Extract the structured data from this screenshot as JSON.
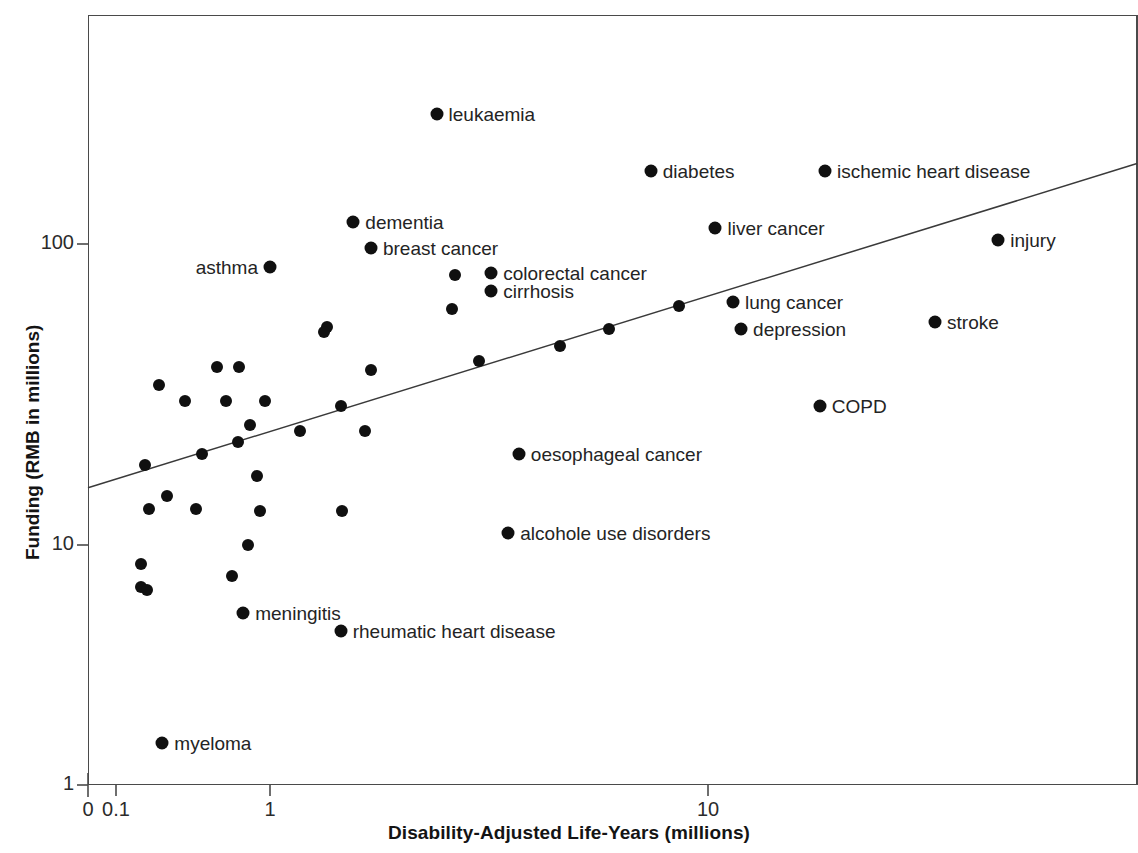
{
  "chart_data": {
    "type": "scatter",
    "title": "",
    "xlabel": "Disability-Adjusted Life-Years (millions)",
    "ylabel": "Funding (RMB in millions)",
    "xscale": "log",
    "yscale": "log",
    "xlim": [
      0.08,
      60
    ],
    "ylim": [
      1,
      400
    ],
    "grid": false,
    "legend": null,
    "x_ticks": [
      {
        "label": "0",
        "value": 0
      },
      {
        "label": "0.1",
        "value": 0.1
      },
      {
        "label": "1",
        "value": 1
      },
      {
        "label": "10",
        "value": 10
      }
    ],
    "y_ticks": [
      {
        "label": "1",
        "value": 1
      },
      {
        "label": "10",
        "value": 10
      },
      {
        "label": "100",
        "value": 100
      }
    ],
    "trendline": {
      "present": true,
      "x1": 0.08,
      "y1": 15.5,
      "x2": 60,
      "y2": 185
    },
    "points": [
      {
        "label": "leukaemia",
        "x": 2.4,
        "y": 270,
        "label_pos": "right"
      },
      {
        "label": "diabetes",
        "x": 7.4,
        "y": 175,
        "label_pos": "right"
      },
      {
        "label": "ischemic heart disease",
        "x": 18.5,
        "y": 175,
        "label_pos": "right"
      },
      {
        "label": "dementia",
        "x": 1.55,
        "y": 118,
        "label_pos": "right"
      },
      {
        "label": "liver cancer",
        "x": 10.4,
        "y": 113,
        "label_pos": "right"
      },
      {
        "label": "injury",
        "x": 46,
        "y": 103,
        "label_pos": "right"
      },
      {
        "label": "breast cancer",
        "x": 1.7,
        "y": 97,
        "label_pos": "right"
      },
      {
        "label": "asthma",
        "x": 1.0,
        "y": 84,
        "label_pos": "left"
      },
      {
        "label": "colorectal cancer",
        "x": 3.2,
        "y": 80,
        "label_pos": "right"
      },
      {
        "label": "cirrhosis",
        "x": 3.2,
        "y": 70,
        "label_pos": "right"
      },
      {
        "label": "lung cancer",
        "x": 11.4,
        "y": 64,
        "label_pos": "right"
      },
      {
        "label": "depression",
        "x": 11.9,
        "y": 52,
        "label_pos": "right"
      },
      {
        "label": "stroke",
        "x": 33,
        "y": 55,
        "label_pos": "right"
      },
      {
        "label": "COPD",
        "x": 18,
        "y": 29,
        "label_pos": "right"
      },
      {
        "label": "oesophageal cancer",
        "x": 3.7,
        "y": 20,
        "label_pos": "right"
      },
      {
        "label": "alcohole use disorders",
        "x": 3.5,
        "y": 11,
        "label_pos": "right"
      },
      {
        "label": "meningitis",
        "x": 0.67,
        "y": 5.2,
        "label_pos": "right"
      },
      {
        "label": "rheumatic heart disease",
        "x": 1.45,
        "y": 4.4,
        "label_pos": "right"
      },
      {
        "label": "myeloma",
        "x": 0.2,
        "y": 1.5,
        "label_pos": "right"
      },
      {
        "label": "",
        "x": 2.65,
        "y": 79,
        "label_pos": "none"
      },
      {
        "label": "",
        "x": 2.6,
        "y": 61,
        "label_pos": "none"
      },
      {
        "label": "",
        "x": 1.35,
        "y": 53,
        "label_pos": "none"
      },
      {
        "label": "",
        "x": 1.33,
        "y": 51,
        "label_pos": "none"
      },
      {
        "label": "",
        "x": 5.95,
        "y": 52,
        "label_pos": "none"
      },
      {
        "label": "",
        "x": 8.6,
        "y": 62,
        "label_pos": "none"
      },
      {
        "label": "",
        "x": 4.6,
        "y": 46,
        "label_pos": "none"
      },
      {
        "label": "",
        "x": 3.0,
        "y": 41,
        "label_pos": "none"
      },
      {
        "label": "",
        "x": 1.7,
        "y": 38,
        "label_pos": "none"
      },
      {
        "label": "",
        "x": 0.45,
        "y": 39,
        "label_pos": "none"
      },
      {
        "label": "",
        "x": 0.63,
        "y": 39,
        "label_pos": "none"
      },
      {
        "label": "",
        "x": 0.19,
        "y": 34,
        "label_pos": "none"
      },
      {
        "label": "",
        "x": 0.28,
        "y": 30,
        "label_pos": "none"
      },
      {
        "label": "",
        "x": 0.52,
        "y": 30,
        "label_pos": "none"
      },
      {
        "label": "",
        "x": 0.93,
        "y": 30,
        "label_pos": "none"
      },
      {
        "label": "",
        "x": 1.45,
        "y": 29,
        "label_pos": "none"
      },
      {
        "label": "",
        "x": 0.74,
        "y": 25,
        "label_pos": "none"
      },
      {
        "label": "",
        "x": 1.17,
        "y": 24,
        "label_pos": "none"
      },
      {
        "label": "",
        "x": 1.65,
        "y": 24,
        "label_pos": "none"
      },
      {
        "label": "",
        "x": 0.62,
        "y": 22,
        "label_pos": "none"
      },
      {
        "label": "",
        "x": 0.36,
        "y": 20,
        "label_pos": "none"
      },
      {
        "label": "",
        "x": 0.155,
        "y": 18.5,
        "label_pos": "none"
      },
      {
        "label": "",
        "x": 0.82,
        "y": 17,
        "label_pos": "none"
      },
      {
        "label": "",
        "x": 0.215,
        "y": 14.5,
        "label_pos": "none"
      },
      {
        "label": "",
        "x": 0.165,
        "y": 13.2,
        "label_pos": "none"
      },
      {
        "label": "",
        "x": 0.33,
        "y": 13.2,
        "label_pos": "none"
      },
      {
        "label": "",
        "x": 0.86,
        "y": 13.0,
        "label_pos": "none"
      },
      {
        "label": "",
        "x": 1.46,
        "y": 13.0,
        "label_pos": "none"
      },
      {
        "label": "",
        "x": 0.72,
        "y": 10.0,
        "label_pos": "none"
      },
      {
        "label": "",
        "x": 0.145,
        "y": 8.3,
        "label_pos": "none"
      },
      {
        "label": "",
        "x": 0.57,
        "y": 7.4,
        "label_pos": "none"
      },
      {
        "label": "",
        "x": 0.145,
        "y": 6.7,
        "label_pos": "none"
      },
      {
        "label": "",
        "x": 0.16,
        "y": 6.5,
        "label_pos": "none"
      }
    ]
  },
  "axis": {
    "x_title": "Disability-Adjusted Life-Years (millions)",
    "y_title": "Funding (RMB in millions)"
  },
  "colors": {
    "point": "#101010",
    "axis": "#4a4a4a",
    "text": "#1a1a1a",
    "trendline": "#3a3a3a",
    "background": "#ffffff"
  }
}
